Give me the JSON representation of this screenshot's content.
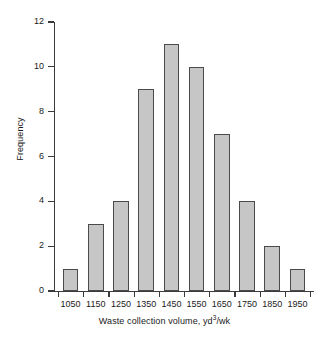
{
  "chart_data": {
    "type": "bar",
    "title": "",
    "subtitle": "",
    "xlabel": "Waste collection volume, yd3/wk",
    "xlabel_base": "Waste collection volume, yd",
    "xlabel_superscript": "3",
    "xlabel_suffix": "/wk",
    "ylabel": "Frequency",
    "categories": [
      "1050",
      "1150",
      "1250",
      "1350",
      "1450",
      "1550",
      "1650",
      "1750",
      "1850",
      "1950"
    ],
    "values": [
      1,
      3,
      4,
      9,
      11,
      10,
      7,
      4,
      2,
      1
    ],
    "ylim": [
      0,
      12
    ],
    "ytick_labels": [
      "0",
      "2",
      "4",
      "6",
      "8",
      "10",
      "12"
    ],
    "ytick_values": [
      0,
      2,
      4,
      6,
      8,
      10,
      12
    ],
    "grid": false,
    "legend": "none",
    "bar_fill_color": "#c6c6c6",
    "bar_edge_color": "#4a4a4a",
    "axis_color": "#3b3b3b",
    "background_color": "#ffffff"
  }
}
